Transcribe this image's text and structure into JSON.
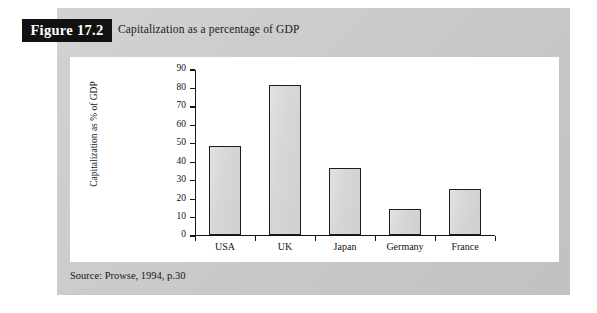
{
  "figure": {
    "badge_label": "Figure 17.2",
    "title": "Capitalization as a percentage of GDP",
    "source_note": "Source: Prowse, 1994, p.30",
    "panel_color": "#c9c9c9",
    "badge_bg_color": "#111111",
    "badge_text_color": "#ffffff",
    "card_color": "#ffffff"
  },
  "chart_data": {
    "type": "bar",
    "title": "Capitalization as a percentage of GDP",
    "xlabel": "",
    "ylabel": "Capitalization as % of GDP",
    "categories": [
      "USA",
      "UK",
      "Japan",
      "Germany",
      "France"
    ],
    "values": [
      48,
      81,
      36,
      14,
      25
    ],
    "ylim": [
      0,
      90
    ],
    "ytick_step": 10,
    "yticks": [
      0,
      10,
      20,
      30,
      40,
      50,
      60,
      70,
      80,
      90
    ],
    "ytick_labels": [
      "0",
      "10",
      "20",
      "30",
      "40",
      "50",
      "60",
      "70",
      "80",
      "90"
    ],
    "grid": false,
    "legend": null,
    "bar_fill_color": "#d6d6d6",
    "bar_edge_color": "#1d1d1d",
    "axis_color": "#141414"
  }
}
